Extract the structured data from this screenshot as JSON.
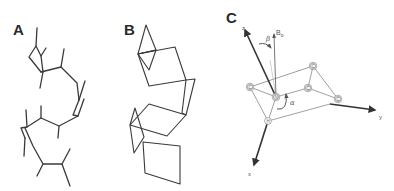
{
  "figure": {
    "panels": [
      {
        "id": "A",
        "label": "A",
        "description": "stick model of molecular conformation"
      },
      {
        "id": "B",
        "label": "B",
        "description": "planar polyhedra representation of molecular conformation"
      },
      {
        "id": "C",
        "label": "C",
        "description": "coordinate frame of peptide plane relative to magnetic field"
      }
    ],
    "panel_c": {
      "axes": {
        "x": "x",
        "y": "y",
        "z": "z"
      },
      "field_label": "B",
      "field_subscript": "o",
      "angles": {
        "alpha": "α",
        "beta": "β"
      },
      "atoms": [
        {
          "symbol": "C",
          "role": "ring-left"
        },
        {
          "symbol": "C",
          "role": "ring-top-right"
        },
        {
          "symbol": "C",
          "role": "ring-middle"
        },
        {
          "symbol": "C",
          "role": "ring-right"
        },
        {
          "symbol": "N",
          "role": "center"
        },
        {
          "symbol": "H",
          "role": "bottom"
        }
      ]
    },
    "colors": {
      "line": "#3a3a3a",
      "thin_line": "#6a6a6a",
      "axis": "#333333",
      "background": "#ffffff"
    }
  }
}
